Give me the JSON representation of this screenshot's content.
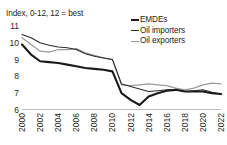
{
  "chart_data": {
    "type": "line",
    "title": "Index, 0-12, 12 = best",
    "xlabel": "",
    "ylabel": "",
    "ylim": [
      6,
      11
    ],
    "yticks": [
      11,
      10,
      9,
      8,
      7,
      6
    ],
    "xticks": [
      "2000",
      "2002",
      "2004",
      "2006",
      "2008",
      "2010",
      "2012",
      "2014",
      "2016",
      "2018",
      "2020",
      "2022"
    ],
    "x": [
      2000,
      2001,
      2002,
      2003,
      2004,
      2005,
      2006,
      2007,
      2008,
      2009,
      2010,
      2011,
      2012,
      2013,
      2014,
      2015,
      2016,
      2017,
      2018,
      2019,
      2020,
      2021,
      2022
    ],
    "grid": false,
    "legend_position": "top-right",
    "series": [
      {
        "name": "EMDEs",
        "color": "#1a1a1a",
        "values": [
          9.9,
          9.3,
          8.9,
          8.85,
          8.8,
          8.7,
          8.6,
          8.5,
          8.45,
          8.4,
          8.3,
          7.0,
          6.6,
          6.3,
          6.8,
          7.0,
          7.15,
          7.2,
          7.1,
          7.1,
          7.1,
          7.0,
          6.95
        ]
      },
      {
        "name": "Oil importers",
        "color": "#2b2b2b",
        "values": [
          10.5,
          10.3,
          10.0,
          9.85,
          9.75,
          9.7,
          9.6,
          9.35,
          9.2,
          9.1,
          9.0,
          7.55,
          7.4,
          7.25,
          7.1,
          7.15,
          7.2,
          7.2,
          7.1,
          7.15,
          7.2,
          7.05,
          6.95
        ]
      },
      {
        "name": "Oil exporters",
        "color": "#9a9a9a",
        "values": [
          10.3,
          9.9,
          9.5,
          9.45,
          9.6,
          9.6,
          9.65,
          9.4,
          9.25,
          9.1,
          9.0,
          7.5,
          7.45,
          7.5,
          7.55,
          7.5,
          7.45,
          7.3,
          7.2,
          7.3,
          7.5,
          7.6,
          7.55
        ]
      }
    ]
  },
  "legend": {
    "items": [
      {
        "label": "EMDEs"
      },
      {
        "label": "Oil importers"
      },
      {
        "label": "Oil exporters"
      }
    ]
  }
}
